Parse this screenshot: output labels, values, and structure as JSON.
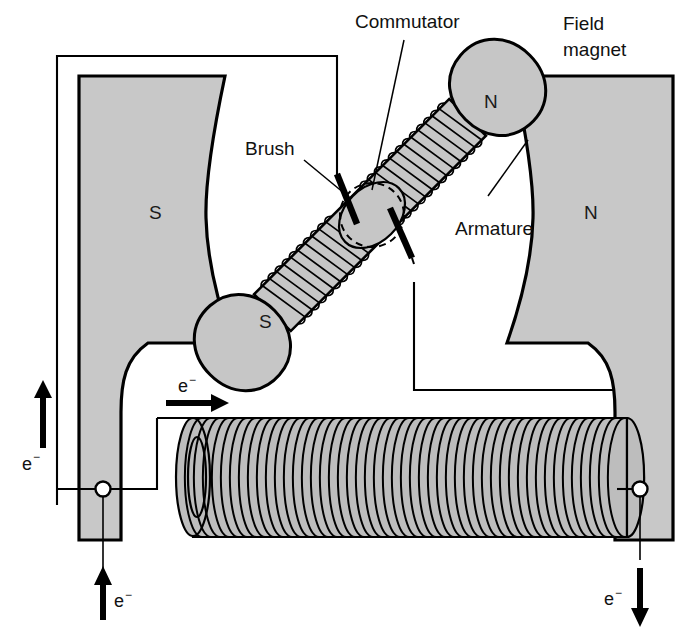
{
  "diagram": {
    "background_color": "#ffffff",
    "line_color": "#000000",
    "magnet_fill_color": "#c8c8c8",
    "armature_fill_color": "#c6c6c6"
  },
  "labels": {
    "commutator": "Commutator",
    "field_magnet_line1": "Field",
    "field_magnet_line2": "magnet",
    "brush": "Brush",
    "armature": "Armature"
  },
  "poles": {
    "field_south": "S",
    "field_north": "N",
    "armature_north": "N",
    "armature_south": "S"
  },
  "electron_flow": {
    "symbol": "e",
    "charge": "−",
    "markers": [
      {
        "id": "left-vertical-up",
        "label": "e",
        "charge": "−",
        "direction": "up"
      },
      {
        "id": "top-horizontal-right",
        "label": "e",
        "charge": "−",
        "direction": "right"
      },
      {
        "id": "bottom-left-up",
        "label": "e",
        "charge": "−",
        "direction": "up"
      },
      {
        "id": "bottom-right-down",
        "label": "e",
        "charge": "−",
        "direction": "down"
      }
    ]
  },
  "components": [
    {
      "name": "field-magnet-left",
      "pole": "S"
    },
    {
      "name": "field-magnet-right",
      "pole": "N"
    },
    {
      "name": "armature",
      "poles": [
        "N",
        "S"
      ]
    },
    {
      "name": "commutator"
    },
    {
      "name": "brush-upper"
    },
    {
      "name": "brush-lower"
    },
    {
      "name": "field-coil-solenoid"
    },
    {
      "name": "terminal-left"
    },
    {
      "name": "terminal-right"
    }
  ]
}
